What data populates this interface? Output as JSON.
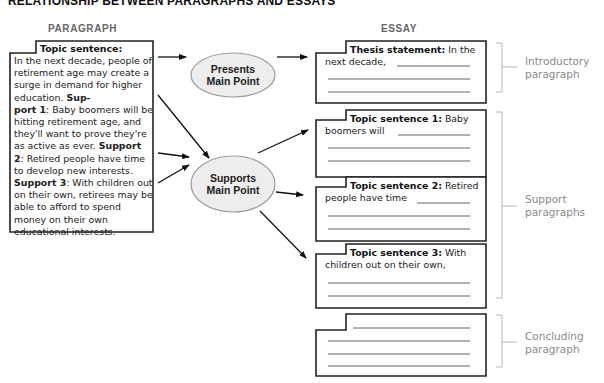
{
  "title": "RELATIONSHIP BETWEEN PARAGRAPHS AND ESSAYS",
  "columns": {
    "paragraph": "PARAGRAPH",
    "essay": "ESSAY"
  },
  "paragraph_box": {
    "heading": "Topic sentence:",
    "segments": [
      {
        "text": "In the next decade, people of retirement age may create a surge in demand for higher education. ",
        "bold": false
      },
      {
        "text": "Sup-port 1",
        "bold": true
      },
      {
        "text": ": Baby boomers will be hitting retirement age, and they'll want to prove they're as active as ever. ",
        "bold": false
      },
      {
        "text": "Support 2",
        "bold": true
      },
      {
        "text": ": Retired people have time to develop new interests. ",
        "bold": false
      },
      {
        "text": "Support 3",
        "bold": true
      },
      {
        "text": ": With children out on their own, retirees may be able to afford to spend money on their own educational interests.",
        "bold": false
      }
    ]
  },
  "nodes": {
    "presents": {
      "line1": "Presents",
      "line2": "Main Point"
    },
    "supports": {
      "line1": "Supports",
      "line2": "Main Point"
    }
  },
  "essay_boxes": [
    {
      "id": "thesis",
      "label": "Thesis statement",
      "sep": ":",
      "text1": " In the",
      "text2": "next decade,"
    },
    {
      "id": "topic1",
      "label": "Topic sentence 1",
      "sep": ":",
      "text1": " Baby",
      "text2": "boomers will"
    },
    {
      "id": "topic2",
      "label": "Topic sentence 2",
      "sep": ":",
      "text1": " Retired",
      "text2": "people have time"
    },
    {
      "id": "topic3",
      "label": "Topic sentence 3",
      "sep": ":",
      "text1": " With",
      "text2": "children out on their own,"
    },
    {
      "id": "conclusion",
      "label": "",
      "sep": "",
      "text1": "",
      "text2": ""
    }
  ],
  "side_labels": {
    "intro": {
      "line1": "Introductory",
      "line2": "paragraph"
    },
    "support": {
      "line1": "Support",
      "line2": "paragraphs"
    },
    "conclusion": {
      "line1": "Concluding",
      "line2": "paragraph"
    }
  },
  "colors": {
    "box_border": "#222222",
    "ellipse_fill": "#ededed",
    "ellipse_stroke": "#9a9a9a",
    "bracket": "#b5b5b5",
    "side_label": "#8a8a8a",
    "header_gray": "#666666"
  }
}
